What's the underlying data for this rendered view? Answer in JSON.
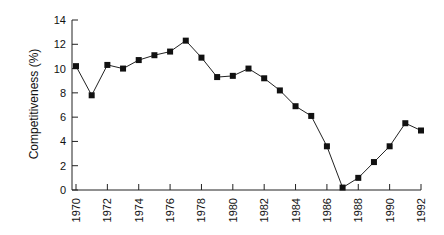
{
  "chart_data": {
    "type": "line",
    "title": "",
    "xlabel": "",
    "ylabel": "Competitiveness (%)",
    "x": [
      1970,
      1971,
      1972,
      1973,
      1974,
      1975,
      1976,
      1977,
      1978,
      1979,
      1980,
      1981,
      1982,
      1983,
      1984,
      1985,
      1986,
      1987,
      1988,
      1989,
      1990,
      1991,
      1992
    ],
    "series": [
      {
        "name": "Competitiveness",
        "values": [
          10.2,
          7.8,
          10.3,
          10.0,
          10.7,
          11.1,
          11.4,
          12.3,
          10.9,
          9.3,
          9.4,
          10.0,
          9.2,
          8.2,
          6.9,
          6.1,
          3.6,
          0.2,
          1.0,
          2.3,
          3.6,
          5.5,
          4.9
        ],
        "marker": "square",
        "color": "#111111"
      }
    ],
    "xticks": [
      "1970",
      "1972",
      "1974",
      "1976",
      "1978",
      "1980",
      "1982",
      "1984",
      "1986",
      "1988",
      "1990",
      "1992"
    ],
    "yticks": [
      "0",
      "2",
      "4",
      "6",
      "8",
      "10",
      "12",
      "14"
    ],
    "xlim": [
      1970,
      1992
    ],
    "ylim": [
      0,
      14
    ],
    "grid": false,
    "legend": null
  }
}
